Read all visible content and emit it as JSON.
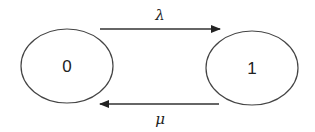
{
  "diagram": {
    "type": "state-transition",
    "states": [
      {
        "id": "state-0",
        "label": "0"
      },
      {
        "id": "state-1",
        "label": "1"
      }
    ],
    "transitions": [
      {
        "from": "0",
        "to": "1",
        "label": "λ"
      },
      {
        "from": "1",
        "to": "0",
        "label": "μ"
      }
    ],
    "colors": {
      "stroke": "#333333",
      "background": "#ffffff"
    }
  }
}
